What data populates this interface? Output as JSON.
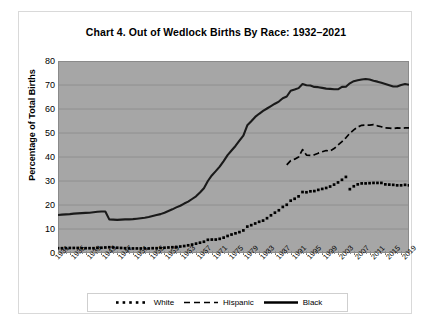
{
  "chart_data": {
    "type": "line",
    "title": "Chart 4. Out of Wedlock Births By Race: 1932–2021",
    "xlabel": "",
    "ylabel": "Percentage of Total Births",
    "ylim": [
      0,
      80
    ],
    "ytick_step": 10,
    "yticks": [
      0,
      10,
      20,
      30,
      40,
      50,
      60,
      70,
      80
    ],
    "xlim": [
      1932,
      2021
    ],
    "xticks": [
      1931,
      1935,
      1939,
      1943,
      1947,
      1951,
      1955,
      1959,
      1963,
      1967,
      1971,
      1975,
      1979,
      1983,
      1987,
      1991,
      1995,
      1999,
      2003,
      2007,
      2011,
      2015,
      2019
    ],
    "grid": true,
    "grid_axis": "y",
    "plot_background": "#a6a6a6",
    "legend_position": "bottom",
    "x": [
      1932,
      1933,
      1934,
      1935,
      1936,
      1937,
      1938,
      1939,
      1940,
      1941,
      1942,
      1943,
      1944,
      1945,
      1946,
      1947,
      1948,
      1949,
      1950,
      1951,
      1952,
      1953,
      1954,
      1955,
      1956,
      1957,
      1958,
      1959,
      1960,
      1961,
      1962,
      1963,
      1964,
      1965,
      1966,
      1967,
      1968,
      1969,
      1970,
      1971,
      1972,
      1973,
      1974,
      1975,
      1976,
      1977,
      1978,
      1979,
      1980,
      1981,
      1982,
      1983,
      1984,
      1985,
      1986,
      1987,
      1988,
      1989,
      1990,
      1991,
      1992,
      1993,
      1994,
      1995,
      1996,
      1997,
      1998,
      1999,
      2000,
      2001,
      2002,
      2003,
      2004,
      2005,
      2006,
      2007,
      2008,
      2009,
      2010,
      2011,
      2012,
      2013,
      2014,
      2015,
      2016,
      2017,
      2018,
      2019,
      2020,
      2021
    ],
    "series": [
      {
        "name": "White",
        "style": "dotted",
        "color": "#000000",
        "values": [
          2.0,
          2.0,
          2.0,
          2.1,
          2.1,
          2.1,
          2.0,
          2.0,
          2.0,
          2.0,
          2.1,
          2.2,
          2.3,
          2.4,
          2.3,
          2.2,
          2.1,
          2.0,
          1.9,
          1.9,
          1.9,
          1.9,
          1.9,
          1.9,
          2.0,
          2.0,
          2.1,
          2.2,
          2.3,
          2.4,
          2.5,
          2.7,
          2.9,
          3.2,
          3.5,
          3.9,
          4.3,
          4.7,
          5.5,
          5.6,
          5.6,
          5.9,
          6.4,
          7.1,
          7.7,
          8.2,
          8.7,
          9.4,
          11.0,
          11.6,
          12.3,
          13.0,
          13.5,
          14.5,
          15.7,
          16.8,
          17.8,
          19.2,
          20.1,
          21.8,
          22.6,
          23.6,
          25.4,
          25.3,
          25.7,
          25.8,
          26.3,
          26.7,
          27.1,
          27.7,
          28.5,
          29.4,
          30.5,
          31.7,
          26.6,
          27.8,
          28.6,
          29.0,
          29.0,
          29.1,
          29.2,
          29.2,
          29.2,
          28.6,
          28.5,
          28.4,
          28.2,
          28.2,
          28.4,
          28.2
        ]
      },
      {
        "name": "Hispanic",
        "style": "dashed",
        "color": "#000000",
        "values": [
          null,
          null,
          null,
          null,
          null,
          null,
          null,
          null,
          null,
          null,
          null,
          null,
          null,
          null,
          null,
          null,
          null,
          null,
          null,
          null,
          null,
          null,
          null,
          null,
          null,
          null,
          null,
          null,
          null,
          null,
          null,
          null,
          null,
          null,
          null,
          null,
          null,
          null,
          null,
          null,
          null,
          null,
          null,
          null,
          null,
          null,
          null,
          null,
          null,
          null,
          null,
          null,
          null,
          null,
          null,
          null,
          null,
          null,
          36.7,
          38.5,
          39.1,
          40.0,
          43.1,
          40.8,
          40.7,
          40.9,
          41.6,
          42.2,
          42.7,
          42.5,
          43.5,
          45.0,
          46.4,
          48.0,
          49.9,
          51.3,
          52.5,
          53.2,
          53.3,
          53.3,
          53.5,
          53.0,
          52.6,
          52.1,
          52.0,
          51.8,
          52.1,
          52.0,
          52.1,
          52.1
        ]
      },
      {
        "name": "Black",
        "style": "solid",
        "color": "#1a1a1a",
        "values": [
          15.8,
          16.0,
          16.1,
          16.2,
          16.4,
          16.5,
          16.6,
          16.7,
          16.8,
          17.0,
          17.2,
          17.3,
          17.3,
          14.0,
          13.9,
          13.8,
          13.9,
          14.0,
          14.0,
          14.1,
          14.3,
          14.5,
          14.7,
          15.0,
          15.4,
          15.8,
          16.2,
          16.8,
          17.5,
          18.2,
          19.0,
          19.7,
          20.6,
          21.4,
          22.5,
          23.6,
          25.2,
          27.0,
          30.0,
          32.3,
          34.1,
          36.0,
          38.3,
          40.8,
          42.7,
          44.6,
          46.8,
          48.9,
          53.2,
          54.9,
          56.7,
          58.0,
          59.2,
          60.2,
          61.2,
          62.2,
          63.1,
          64.5,
          65.2,
          67.6,
          68.1,
          68.7,
          70.4,
          69.9,
          69.8,
          69.2,
          69.1,
          68.8,
          68.5,
          68.4,
          68.2,
          68.2,
          69.2,
          69.3,
          70.7,
          71.6,
          72.0,
          72.3,
          72.5,
          72.3,
          71.8,
          71.4,
          70.9,
          70.4,
          69.9,
          69.4,
          69.4,
          70.0,
          70.4,
          70.1
        ]
      }
    ]
  },
  "legend": {
    "items": [
      {
        "label": "White",
        "marker": "dotted-line"
      },
      {
        "label": "Hispanic",
        "marker": "dashed-line"
      },
      {
        "label": "Black",
        "marker": "solid-line"
      }
    ]
  }
}
